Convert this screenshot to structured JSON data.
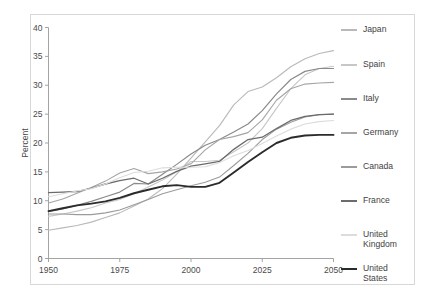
{
  "chart_data": {
    "type": "line",
    "title": "",
    "xlabel": "",
    "ylabel": "Percent",
    "xlim": [
      1950,
      2050
    ],
    "ylim": [
      0,
      40
    ],
    "xticks": [
      1950,
      1975,
      2000,
      2025,
      2050
    ],
    "yticks": [
      0,
      5,
      10,
      15,
      20,
      25,
      30,
      35,
      40
    ],
    "grid": false,
    "legend_position": "right",
    "x": [
      1950,
      1955,
      1960,
      1965,
      1970,
      1975,
      1980,
      1985,
      1990,
      1995,
      2000,
      2005,
      2010,
      2015,
      2020,
      2025,
      2030,
      2035,
      2040,
      2045,
      2050
    ],
    "series": [
      {
        "name": "Japan",
        "color": "#b9b9b9",
        "width": 1.1,
        "values": [
          4.9,
          5.3,
          5.7,
          6.3,
          7.1,
          7.9,
          9.1,
          10.3,
          12.1,
          14.6,
          17.4,
          20.2,
          23.0,
          26.6,
          28.9,
          29.7,
          31.3,
          33.2,
          34.6,
          35.5,
          36.0
        ]
      },
      {
        "name": "Spain",
        "color": "#c7c7c7",
        "width": 1.1,
        "values": [
          7.3,
          7.7,
          8.2,
          8.8,
          9.6,
          10.2,
          11.2,
          12.4,
          13.6,
          15.0,
          16.8,
          16.8,
          17.0,
          18.5,
          20.0,
          22.5,
          26.0,
          29.4,
          31.8,
          32.9,
          33.3
        ]
      },
      {
        "name": "Italy",
        "color": "#8a8a8a",
        "width": 1.2,
        "values": [
          8.1,
          8.6,
          9.2,
          9.9,
          10.7,
          11.5,
          13.0,
          12.9,
          14.6,
          16.3,
          18.1,
          19.6,
          20.6,
          21.9,
          23.3,
          25.6,
          28.5,
          31.0,
          32.4,
          32.9,
          32.9
        ]
      },
      {
        "name": "Germany",
        "color": "#a5a5a5",
        "width": 1.1,
        "values": [
          9.6,
          10.3,
          11.3,
          12.3,
          13.4,
          14.8,
          15.6,
          14.7,
          15.0,
          15.5,
          16.4,
          18.8,
          20.6,
          21.1,
          21.8,
          24.0,
          27.4,
          29.4,
          30.2,
          30.4,
          30.5
        ]
      },
      {
        "name": "Canada",
        "color": "#9b9b9b",
        "width": 1.1,
        "values": [
          7.7,
          7.7,
          7.6,
          7.6,
          7.9,
          8.4,
          9.3,
          10.2,
          11.2,
          11.9,
          12.6,
          13.2,
          14.1,
          16.1,
          18.2,
          20.6,
          22.4,
          23.6,
          24.5,
          24.9,
          25.0
        ]
      },
      {
        "name": "France",
        "color": "#6b6b6b",
        "width": 1.3,
        "values": [
          11.4,
          11.5,
          11.6,
          12.2,
          12.9,
          13.5,
          13.9,
          12.9,
          13.9,
          15.1,
          16.0,
          16.4,
          16.8,
          18.9,
          20.6,
          21.0,
          22.5,
          23.9,
          24.6,
          24.9,
          25.0
        ]
      },
      {
        "name": "United Kingdom",
        "color": "#dcdcdc",
        "width": 1.1,
        "values": [
          10.7,
          11.2,
          11.7,
          12.1,
          12.9,
          14.0,
          14.9,
          15.1,
          15.7,
          15.8,
          15.8,
          15.9,
          16.6,
          17.8,
          18.7,
          19.9,
          21.2,
          22.4,
          23.3,
          23.7,
          23.9
        ]
      },
      {
        "name": "United States",
        "color": "#2b2b2b",
        "width": 1.9,
        "values": [
          8.2,
          8.7,
          9.2,
          9.5,
          9.9,
          10.5,
          11.3,
          11.9,
          12.5,
          12.7,
          12.4,
          12.4,
          13.1,
          14.9,
          16.7,
          18.4,
          20.0,
          20.9,
          21.3,
          21.4,
          21.4
        ]
      }
    ]
  },
  "axes": {
    "ylabel": "Percent",
    "xticklabels": [
      "1950",
      "1975",
      "2000",
      "2025",
      "2050"
    ],
    "yticklabels": [
      "0",
      "5",
      "10",
      "15",
      "20",
      "25",
      "30",
      "35",
      "40"
    ]
  },
  "legend": {
    "entries": [
      {
        "label": "Japan",
        "color": "#b9b9b9"
      },
      {
        "label": "Spain",
        "color": "#c7c7c7"
      },
      {
        "label": "Italy",
        "color": "#8a8a8a"
      },
      {
        "label": "Germany",
        "color": "#a5a5a5"
      },
      {
        "label": "Canada",
        "color": "#9b9b9b"
      },
      {
        "label": "France",
        "color": "#6b6b6b"
      },
      {
        "label": "United\nKingdom",
        "color": "#dcdcdc"
      },
      {
        "label": "United\nStates",
        "color": "#2b2b2b"
      }
    ]
  },
  "style": {
    "frame_color": "#9a9a9a",
    "border_color": "#d8d8d8",
    "background": "#ffffff"
  }
}
